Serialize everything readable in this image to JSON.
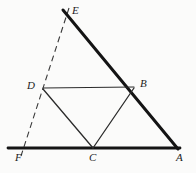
{
  "figure": {
    "background_color": "#fbfbfa",
    "ink_color": "#1c1c1c",
    "thick_stroke_color": "#141414",
    "thin_stroke_color": "#2b2b2b",
    "dashed_stroke_color": "#3a3a3a",
    "width": 196,
    "height": 173,
    "vertices": [
      {
        "id": "E",
        "label": "E",
        "x": 63,
        "y": 10,
        "label_x": 72,
        "label_y": 5
      },
      {
        "id": "B",
        "label": "B",
        "x": 134,
        "y": 87,
        "label_x": 140,
        "label_y": 78
      },
      {
        "id": "A",
        "label": "A",
        "x": 178,
        "y": 148,
        "label_x": 176,
        "label_y": 152
      },
      {
        "id": "C",
        "label": "C",
        "x": 93,
        "y": 148,
        "label_x": 89,
        "label_y": 152
      },
      {
        "id": "F",
        "label": "F",
        "x": 23,
        "y": 148,
        "label_x": 15,
        "label_y": 152
      },
      {
        "id": "D",
        "label": "D",
        "x": 43,
        "y": 88,
        "label_x": 27,
        "label_y": 80
      }
    ],
    "segments": [
      {
        "id": "EA",
        "from": "E",
        "to": "A",
        "style": "thick",
        "x1": 63,
        "y1": 10,
        "x2": 178,
        "y2": 149
      },
      {
        "id": "FA",
        "from": "F",
        "to": "A",
        "style": "thick",
        "x1": 8,
        "y1": 148,
        "x2": 180,
        "y2": 148
      },
      {
        "id": "EF",
        "from": "E",
        "to": "F",
        "style": "dashed",
        "x1": 69,
        "y1": 8,
        "x2": 21,
        "y2": 156
      },
      {
        "id": "DB",
        "from": "D",
        "to": "B",
        "style": "thin",
        "x1": 43,
        "y1": 88,
        "x2": 134,
        "y2": 87
      },
      {
        "id": "DC",
        "from": "D",
        "to": "C",
        "style": "thin",
        "x1": 43,
        "y1": 89,
        "x2": 93,
        "y2": 148
      },
      {
        "id": "BC",
        "from": "B",
        "to": "C",
        "style": "thin",
        "x1": 134,
        "y1": 88,
        "x2": 93,
        "y2": 148
      }
    ],
    "labels": [
      "E",
      "B",
      "A",
      "C",
      "F",
      "D"
    ]
  }
}
